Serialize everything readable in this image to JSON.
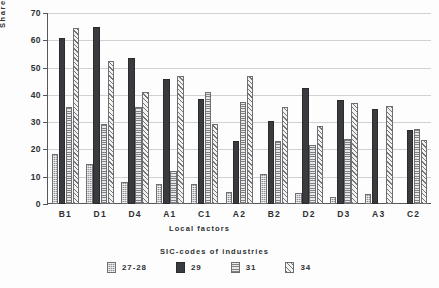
{
  "chart_data": {
    "type": "bar",
    "title": "",
    "subtitle": "",
    "xlabel": "Local factors",
    "ylabel": "Share of firms (%)",
    "ylim": [
      0,
      70
    ],
    "yticks": [
      0,
      10,
      20,
      30,
      40,
      50,
      60,
      70
    ],
    "ytick_labels": [
      "0",
      "10",
      "20",
      "30",
      "40",
      "50",
      "60",
      "70"
    ],
    "grid": true,
    "grid_axis": "y",
    "legend_title": "SIC-codes of industries",
    "legend_position": "bottom",
    "categories": [
      "B1",
      "D1",
      "D4",
      "A1",
      "C1",
      "A2",
      "B2",
      "D2",
      "D3",
      "A3",
      "C2"
    ],
    "series": [
      {
        "name": "27-28",
        "pattern": "grey-dither",
        "color": "#8e9094",
        "values": [
          18.5,
          14.5,
          8.0,
          7.5,
          7.5,
          4.5,
          11.0,
          4.0,
          2.5,
          3.5,
          0
        ]
      },
      {
        "name": "29",
        "pattern": "solid-dark",
        "color": "#3a3b3e",
        "values": [
          61.0,
          65.0,
          53.5,
          46.0,
          38.5,
          23.0,
          30.5,
          42.5,
          38.0,
          35.0,
          27.0
        ]
      },
      {
        "name": "31",
        "pattern": "horizontal-lines",
        "color": "#e8e8e6",
        "values": [
          35.5,
          29.5,
          35.5,
          12.0,
          41.0,
          37.5,
          23.0,
          21.5,
          24.0,
          0,
          27.5
        ]
      },
      {
        "name": "34",
        "pattern": "diagonal-hatch",
        "color": "#f2f2f0",
        "values": [
          64.5,
          52.5,
          41.0,
          47.0,
          29.5,
          47.0,
          35.5,
          28.5,
          37.0,
          36.0,
          23.5
        ]
      }
    ]
  }
}
